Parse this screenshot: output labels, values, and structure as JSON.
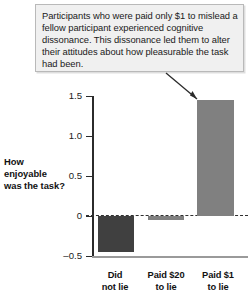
{
  "callout": {
    "text": "Participants who were paid only $1 to mislead a fellow participant experienced cognitive dissonance. This dissonance led them to alter their attitudes about how pleasurable the task had been.",
    "background_color": "#f0f0f0",
    "border_color": "#b9b9b9",
    "points_to": "Paid $1 to lie"
  },
  "chart_data": {
    "type": "bar",
    "title": "",
    "subtitle": "",
    "xlabel": "",
    "ylabel": "How enjoyable was the task?",
    "categories": [
      "Did not lie",
      "Paid $20 to lie",
      "Paid $1 to lie"
    ],
    "category_lines": [
      [
        "Did",
        "not lie"
      ],
      [
        "Paid $20",
        "to lie"
      ],
      [
        "Paid $1",
        "to lie"
      ]
    ],
    "values": [
      -0.45,
      -0.05,
      1.45
    ],
    "bar_colors": [
      "#404040",
      "#808080",
      "#808080"
    ],
    "ylim": [
      -0.5,
      1.5
    ],
    "yticks": [
      1.5,
      1.0,
      0.5,
      0,
      -0.5
    ],
    "ytick_labels": [
      "1.5",
      "1.0",
      "0.5",
      "0",
      "–0.5"
    ],
    "grid": false,
    "zero_line": true,
    "zero_line_style": "dashed",
    "legend": "none"
  }
}
